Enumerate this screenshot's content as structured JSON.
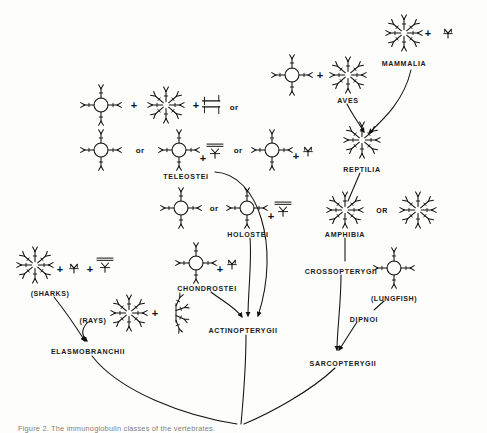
{
  "figure": {
    "domain": "scientific-diagram",
    "caption": "Figure 2.  The immunoglobulin classes of the vertebrates.",
    "background_color": "#fdfdfc",
    "ink_color": "#111111"
  },
  "operators": {
    "plus": "+",
    "or_lower": "or",
    "or_upper": "OR"
  },
  "taxa": [
    {
      "id": "mammalia",
      "label": "MAMMALIA",
      "x": 404,
      "y": 60
    },
    {
      "id": "aves",
      "label": "AVES",
      "x": 348,
      "y": 97
    },
    {
      "id": "reptilia",
      "label": "REPTILIA",
      "x": 362,
      "y": 166
    },
    {
      "id": "amphibia",
      "label": "AMPHIBIA",
      "x": 345,
      "y": 231
    },
    {
      "id": "crossopterygii",
      "label": "CROSSOPTERYGII",
      "x": 341,
      "y": 268
    },
    {
      "id": "lungfish",
      "label": "(LUNGFISH)",
      "x": 394,
      "y": 295
    },
    {
      "id": "dipnoi",
      "label": "DIPNOI",
      "x": 364,
      "y": 316
    },
    {
      "id": "sarcopterygii",
      "label": "SARCOPTERYGII",
      "x": 343,
      "y": 360
    },
    {
      "id": "teleostei",
      "label": "TELEOSTEI",
      "x": 186,
      "y": 173
    },
    {
      "id": "holostei",
      "label": "HOLOSTEI",
      "x": 248,
      "y": 231
    },
    {
      "id": "chondrostei",
      "label": "CHONDROSTEI",
      "x": 207,
      "y": 285
    },
    {
      "id": "actinopterygii",
      "label": "ACTINOPTERYGII",
      "x": 243,
      "y": 327
    },
    {
      "id": "sharks",
      "label": "(SHARKS)",
      "x": 50,
      "y": 290
    },
    {
      "id": "rays",
      "label": "(RAYS)",
      "x": 93,
      "y": 317
    },
    {
      "id": "elasmobranchii",
      "label": "ELASMOBRANCHII",
      "x": 88,
      "y": 348
    }
  ],
  "molecules": [
    {
      "id": "mammalia-ig",
      "type": "star",
      "x": 404,
      "y": 33,
      "size": 34
    },
    {
      "id": "mammalia-mono",
      "type": "mono",
      "x": 448,
      "y": 34,
      "size": 15
    },
    {
      "id": "aves-ring",
      "type": "ring",
      "x": 292,
      "y": 75,
      "size": 34
    },
    {
      "id": "aves-star",
      "type": "star",
      "x": 348,
      "y": 75,
      "size": 34
    },
    {
      "id": "reptilia-star",
      "type": "star",
      "x": 362,
      "y": 140,
      "size": 34
    },
    {
      "id": "amphibia-starA",
      "type": "star",
      "x": 345,
      "y": 210,
      "size": 34
    },
    {
      "id": "amphibia-starB",
      "type": "star",
      "x": 418,
      "y": 210,
      "size": 34
    },
    {
      "id": "lungfish-ring",
      "type": "ring",
      "x": 394,
      "y": 268,
      "size": 34
    },
    {
      "id": "tel1-ring",
      "type": "ring",
      "x": 101,
      "y": 105,
      "size": 34
    },
    {
      "id": "tel1-star",
      "type": "star",
      "x": 166,
      "y": 105,
      "size": 34
    },
    {
      "id": "tel1-dimer",
      "type": "dimer",
      "x": 213,
      "y": 106,
      "size": 17
    },
    {
      "id": "tel2-ring1",
      "type": "ring",
      "x": 101,
      "y": 150,
      "size": 34
    },
    {
      "id": "tel2-ring2",
      "type": "ring",
      "x": 179,
      "y": 150,
      "size": 34
    },
    {
      "id": "tel2-unitA",
      "type": "cross",
      "x": 215,
      "y": 154,
      "size": 16
    },
    {
      "id": "tel2-ring3",
      "type": "ring",
      "x": 272,
      "y": 150,
      "size": 34
    },
    {
      "id": "tel2-unitB",
      "type": "mono",
      "x": 308,
      "y": 152,
      "size": 15
    },
    {
      "id": "hol-ring1",
      "type": "ring",
      "x": 181,
      "y": 208,
      "size": 34
    },
    {
      "id": "hol-ring2",
      "type": "ring",
      "x": 247,
      "y": 208,
      "size": 34
    },
    {
      "id": "hol-unit",
      "type": "cross",
      "x": 283,
      "y": 212,
      "size": 16
    },
    {
      "id": "chon-ring",
      "type": "ring",
      "x": 196,
      "y": 263,
      "size": 34
    },
    {
      "id": "chon-unit",
      "type": "mono",
      "x": 232,
      "y": 265,
      "size": 15
    },
    {
      "id": "sharks-star",
      "type": "star",
      "x": 35,
      "y": 265,
      "size": 34
    },
    {
      "id": "sharks-mono",
      "type": "mono",
      "x": 74,
      "y": 269,
      "size": 15
    },
    {
      "id": "sharks-cross",
      "type": "cross",
      "x": 105,
      "y": 268,
      "size": 16
    },
    {
      "id": "rays-star",
      "type": "star",
      "x": 129,
      "y": 313,
      "size": 34
    },
    {
      "id": "rays-half",
      "type": "half",
      "x": 176,
      "y": 313,
      "size": 22
    }
  ],
  "inline_operators": [
    {
      "id": "op-mammalia-plus",
      "sym": "+",
      "kind": "plus",
      "x": 428,
      "y": 33
    },
    {
      "id": "op-aves-plus",
      "sym": "+",
      "kind": "plus",
      "x": 320,
      "y": 75
    },
    {
      "id": "op-amphibia-or",
      "sym": "OR",
      "kind": "wordcap",
      "x": 382,
      "y": 210
    },
    {
      "id": "op-tel1-plus1",
      "sym": "+",
      "kind": "plus",
      "x": 134,
      "y": 105
    },
    {
      "id": "op-tel1-plus2",
      "sym": "+",
      "kind": "plus",
      "x": 196,
      "y": 105
    },
    {
      "id": "op-tel1-or",
      "sym": "or",
      "kind": "word",
      "x": 234,
      "y": 107
    },
    {
      "id": "op-tel2-or1",
      "sym": "or",
      "kind": "word",
      "x": 140,
      "y": 150
    },
    {
      "id": "op-tel2-plus1",
      "sym": "+",
      "kind": "plus",
      "x": 203,
      "y": 158
    },
    {
      "id": "op-tel2-or2",
      "sym": "or",
      "kind": "word",
      "x": 238,
      "y": 150
    },
    {
      "id": "op-tel2-plus2",
      "sym": "+",
      "kind": "plus",
      "x": 296,
      "y": 156
    },
    {
      "id": "op-hol-or",
      "sym": "or",
      "kind": "word",
      "x": 214,
      "y": 208
    },
    {
      "id": "op-hol-plus",
      "sym": "+",
      "kind": "plus",
      "x": 271,
      "y": 216
    },
    {
      "id": "op-chon-plus",
      "sym": "+",
      "kind": "plus",
      "x": 220,
      "y": 269
    },
    {
      "id": "op-sharks-plus1",
      "sym": "+",
      "kind": "plus",
      "x": 60,
      "y": 269
    },
    {
      "id": "op-sharks-plus2",
      "sym": "+",
      "kind": "plus",
      "x": 90,
      "y": 269
    },
    {
      "id": "op-rays-plus",
      "sym": "+",
      "kind": "plus",
      "x": 155,
      "y": 313
    }
  ],
  "connections": [
    {
      "id": "edge-mammalia-reptilia",
      "from": "mammalia",
      "to": "reptilia",
      "d": "M 411,70 C 404,100 385,118 369,133",
      "arrow": true
    },
    {
      "id": "edge-aves-reptilia",
      "from": "aves",
      "to": "reptilia",
      "d": "M 347,104 C 352,114 358,122 364,132",
      "arrow": true
    },
    {
      "id": "edge-reptilia-amphibia",
      "from": "reptilia",
      "to": "amphibia",
      "d": "M 360,173 L 348,201",
      "arrow": false
    },
    {
      "id": "edge-amphibia-cross",
      "from": "amphibia",
      "to": "crossopterygii",
      "d": "M 345,238 L 345,261",
      "arrow": false
    },
    {
      "id": "edge-lungfish-dipnoi",
      "from": "lungfish",
      "to": "dipnoi",
      "d": "M 384,301 L 374,310",
      "arrow": false
    },
    {
      "id": "edge-cross-sarco",
      "from": "crossopterygii",
      "to": "sarcopterygii",
      "d": "M 341,275 C 341,305 337,330 337,350",
      "arrow": true
    },
    {
      "id": "edge-dipnoi-sarco",
      "from": "dipnoi",
      "to": "sarcopterygii",
      "d": "M 357,322 L 339,350",
      "arrow": true
    },
    {
      "id": "edge-teleostei-actino",
      "from": "teleostei",
      "to": "actinopterygii",
      "d": "M 215,172 C 258,174 281,246 258,316",
      "arrow": true
    },
    {
      "id": "edge-holostei-actino",
      "from": "holostei",
      "to": "actinopterygii",
      "d": "M 250,238 C 252,262 248,292 248,316",
      "arrow": true
    },
    {
      "id": "edge-chondrostei-actino",
      "from": "chondrostei",
      "to": "actinopterygii",
      "d": "M 211,292 C 224,302 236,308 242,317",
      "arrow": true
    },
    {
      "id": "edge-sharks-elasmo",
      "from": "sharks",
      "to": "elasmobranchii",
      "d": "M 54,297 C 66,312 76,327 85,341",
      "arrow": true
    },
    {
      "id": "edge-rays-elasmo",
      "from": "rays",
      "to": "elasmobranchii",
      "d": "M 88,322 C 80,330 82,336 87,341",
      "arrow": true
    },
    {
      "id": "edge-elasmo-root",
      "from": "elasmobranchii",
      "to": "root",
      "d": "M 92,356 C 120,392 185,416 237,424",
      "arrow": false
    },
    {
      "id": "edge-actino-root",
      "from": "actinopterygii",
      "to": "root",
      "d": "M 246,335 C 246,370 243,402 241,424",
      "arrow": false
    },
    {
      "id": "edge-sarco-root",
      "from": "sarcopterygii",
      "to": "root",
      "d": "M 335,368 C 310,392 268,414 244,424",
      "arrow": false
    }
  ]
}
